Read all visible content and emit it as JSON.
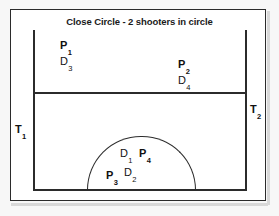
{
  "diagram": {
    "title": "Close Circle - 2 shooters in circle",
    "labels": {
      "p1": {
        "base": "P",
        "sub": "1"
      },
      "d3": {
        "base": "D",
        "sub": "3"
      },
      "p2": {
        "base": "P",
        "sub": "2"
      },
      "d4": {
        "base": "D",
        "sub": "4"
      },
      "t1": {
        "base": "T",
        "sub": "1"
      },
      "t2": {
        "base": "T",
        "sub": "2"
      },
      "d1": {
        "base": "D",
        "sub": "1"
      },
      "p4": {
        "base": "P",
        "sub": "4"
      },
      "p3": {
        "base": "P",
        "sub": "3"
      },
      "d2": {
        "base": "D",
        "sub": "2"
      }
    },
    "colors": {
      "line": "#2b2b2b",
      "text": "#111111",
      "page": "#ffffff",
      "background": "#f7f7f7"
    }
  }
}
